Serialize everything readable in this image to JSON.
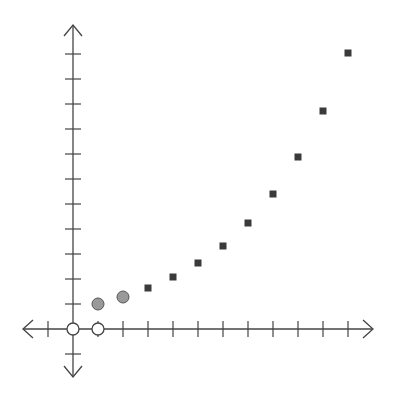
{
  "chart_data": {
    "type": "scatter",
    "title": "",
    "xlabel": "",
    "ylabel": "",
    "grid": false,
    "legend": null,
    "axis": {
      "origin_px": [
        73,
        329
      ],
      "unit_px": 25,
      "x_range": [
        -2,
        12
      ],
      "y_range": [
        -2,
        12
      ],
      "x_ticks": [
        -1,
        1,
        2,
        3,
        4,
        5,
        6,
        7,
        8,
        9,
        10,
        11
      ],
      "y_ticks": [
        -1,
        1,
        2,
        3,
        4,
        5,
        6,
        7,
        8,
        9,
        10,
        11
      ],
      "tick_labels_shown": false,
      "arrows": true
    },
    "series": [
      {
        "name": "open-circles",
        "marker": "circle-open",
        "color": "#ffffff",
        "stroke": "#444444",
        "points": [
          [
            0,
            0
          ],
          [
            1,
            0
          ]
        ]
      },
      {
        "name": "gray-circles",
        "marker": "circle-filled",
        "color": "#999999",
        "stroke": "#555555",
        "points": [
          [
            1,
            1.0
          ],
          [
            2,
            1.28
          ]
        ]
      },
      {
        "name": "dark-squares",
        "marker": "square",
        "color": "#3a3a3a",
        "points": [
          [
            3,
            1.64
          ],
          [
            4,
            2.08
          ],
          [
            5,
            2.64
          ],
          [
            6,
            3.32
          ],
          [
            7,
            4.24
          ],
          [
            8,
            5.4
          ],
          [
            9,
            6.88
          ],
          [
            10,
            8.72
          ],
          [
            11,
            11.04
          ]
        ]
      }
    ]
  }
}
